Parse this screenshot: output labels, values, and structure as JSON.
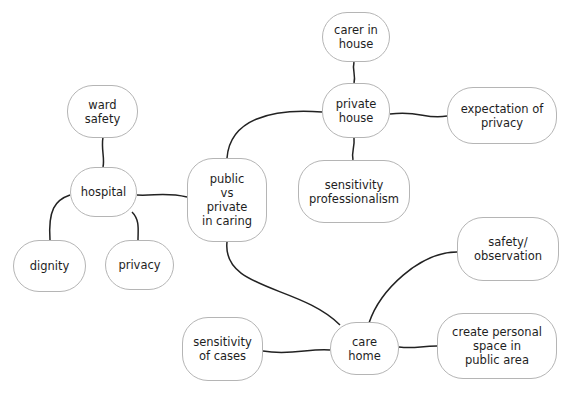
{
  "diagram": {
    "type": "mind-map",
    "line_color": "#222222",
    "node_border_color": "#b5b5b5",
    "nodes": [
      {
        "id": "center",
        "label": "public\nvs\nprivate\nin caring",
        "x": 187,
        "y": 158,
        "w": 80,
        "h": 84
      },
      {
        "id": "hospital",
        "label": "hospital",
        "x": 70,
        "y": 167,
        "w": 67,
        "h": 50
      },
      {
        "id": "ward_safety",
        "label": "ward\nsafety",
        "x": 67,
        "y": 85,
        "w": 71,
        "h": 53
      },
      {
        "id": "dignity",
        "label": "dignity",
        "x": 13,
        "y": 240,
        "w": 73,
        "h": 52
      },
      {
        "id": "privacy",
        "label": "privacy",
        "x": 105,
        "y": 240,
        "w": 69,
        "h": 50
      },
      {
        "id": "private_house",
        "label": "private\nhouse",
        "x": 322,
        "y": 83,
        "w": 68,
        "h": 55
      },
      {
        "id": "carer_in_house",
        "label": "carer in\nhouse",
        "x": 322,
        "y": 12,
        "w": 68,
        "h": 50
      },
      {
        "id": "expectation_of_privacy",
        "label": "expectation of\nprivacy",
        "x": 447,
        "y": 87,
        "w": 110,
        "h": 57
      },
      {
        "id": "sensitivity_professionalism",
        "label": "sensitivity\nprofessionalism",
        "x": 298,
        "y": 160,
        "w": 112,
        "h": 63
      },
      {
        "id": "care_home",
        "label": "care\nhome",
        "x": 330,
        "y": 322,
        "w": 69,
        "h": 53
      },
      {
        "id": "safety_observation",
        "label": "safety/\nobservation",
        "x": 457,
        "y": 217,
        "w": 102,
        "h": 64
      },
      {
        "id": "create_personal_space",
        "label": "create personal\nspace in\npublic area",
        "x": 437,
        "y": 313,
        "w": 120,
        "h": 66
      },
      {
        "id": "sensitivity_of_cases",
        "label": "sensitivity\nof cases",
        "x": 182,
        "y": 317,
        "w": 81,
        "h": 64
      }
    ],
    "edges": [
      {
        "from": "center",
        "to": "hospital",
        "path": "M187,197 C165,192 155,196 137,195"
      },
      {
        "from": "hospital",
        "to": "ward_safety",
        "path": "M103,137 C101,150 105,158 103,167"
      },
      {
        "from": "hospital",
        "to": "dignity",
        "path": "M70,195 C55,200 48,210 50,240"
      },
      {
        "from": "hospital",
        "to": "privacy",
        "path": "M132,212 C140,220 138,230 138,240"
      },
      {
        "from": "center",
        "to": "private_house",
        "path": "M227,158 C230,120 270,108 322,112"
      },
      {
        "from": "private_house",
        "to": "carer_in_house",
        "path": "M354,62 C352,70 356,75 354,83"
      },
      {
        "from": "private_house",
        "to": "expectation_of_privacy",
        "path": "M390,114 C420,110 425,120 447,116"
      },
      {
        "from": "private_house",
        "to": "sensitivity_professionalism",
        "path": "M354,138 C355,148 351,152 353,160"
      },
      {
        "from": "center",
        "to": "care_home",
        "path": "M227,242 C222,290 300,285 340,325"
      },
      {
        "from": "care_home",
        "to": "safety_observation",
        "path": "M369,323 C380,290 420,252 457,252"
      },
      {
        "from": "care_home",
        "to": "create_personal_space",
        "path": "M399,347 C415,349 420,346 437,346"
      },
      {
        "from": "care_home",
        "to": "sensitivity_of_cases",
        "path": "M263,351 C290,356 310,348 330,350"
      }
    ]
  }
}
